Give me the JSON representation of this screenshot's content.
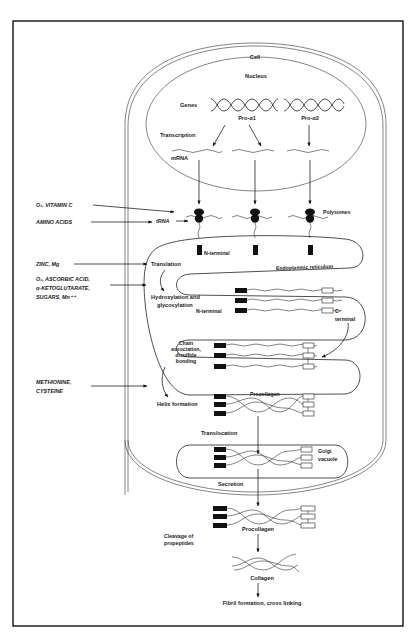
{
  "diagram": {
    "compartments": {
      "cell": "Cell",
      "nucleus": "Nucleus",
      "er": "Endoplasmic reticulum",
      "golgi_line1": "Golgi",
      "golgi_line2": "vacuole"
    },
    "nucleus_labels": {
      "genes": "Genes",
      "gene1": "Pro-α1",
      "gene2": "Pro-α2",
      "transcription": "Transcription",
      "mrna": "mRNA"
    },
    "cytoplasm_labels": {
      "trna": "tRNA",
      "polysomes": "Polysomes",
      "n_terminal_1": "N-terminal",
      "translation": "Translation",
      "hydroxylation_line1": "Hydroxylation and",
      "hydroxylation_line2": "glycosylation",
      "n_terminal_2": "N-terminal",
      "c_terminal_line1": "C-",
      "c_terminal_line2": "terminal",
      "chain_line1": "Chain",
      "chain_line2": "association,",
      "chain_line3": "disulfide",
      "chain_line4": "bonding",
      "helix": "Helix formation",
      "procollagen_er": "Procollagen",
      "translocation": "Translocation",
      "secretion": "Secretion"
    },
    "extracellular_labels": {
      "procollagen": "Procollagen",
      "cleavage_line1": "Cleavage of",
      "cleavage_line2": "propeptides",
      "collagen": "Collagen",
      "fibril": "Fibril formation, cross linking"
    },
    "cofactors": [
      {
        "lines": [
          "O₂, VITAMIN C"
        ],
        "target": "tRNA"
      },
      {
        "lines": [
          "AMINO ACIDS"
        ],
        "target": "tRNA"
      },
      {
        "lines": [
          "ZINC, Mg"
        ],
        "target": "Translation"
      },
      {
        "lines": [
          "O₂, ASCORBIC ACID,",
          "α-KETOGLUTARATE,",
          "SUGARS, Mn⁺⁺"
        ],
        "target": "Hydroxylation and glycosylation"
      },
      {
        "lines": [
          "METHIONINE,",
          "CYSTEINE"
        ],
        "target": "Helix formation"
      }
    ]
  }
}
